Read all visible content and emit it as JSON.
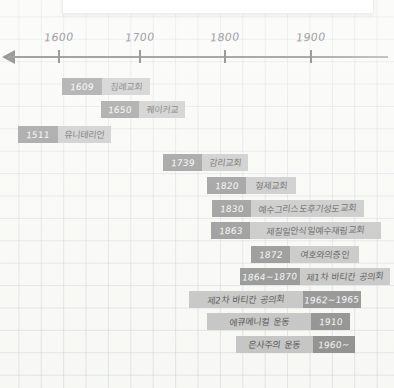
{
  "caption": {
    "text": "( 자료 출처 : 한국 기독교 총람(교회사, 2010)"
  },
  "axis": {
    "ticks": [
      {
        "label": "1600",
        "x": 58
      },
      {
        "label": "1700",
        "x": 139
      },
      {
        "label": "1800",
        "x": 224
      },
      {
        "label": "1900",
        "x": 310
      }
    ]
  },
  "colors": {
    "date_block": "#7b7b7b",
    "label_block": "#b9b9b9",
    "axis": "#3c3c3c",
    "paper": "#f7f7f3",
    "grid": "#96aabe"
  },
  "events": [
    {
      "date": "1609",
      "label": "침례교회",
      "x": 62,
      "y": 78,
      "date_w": 32,
      "total_w": 88,
      "reversed": false
    },
    {
      "date": "1650",
      "label": "퀘이커교",
      "x": 101,
      "y": 101,
      "date_w": 30,
      "total_w": 84,
      "reversed": false
    },
    {
      "date": "1511",
      "label": "유니테리언",
      "x": 18,
      "y": 126,
      "date_w": 32,
      "total_w": 92,
      "reversed": false
    },
    {
      "date": "1739",
      "label": "감리교회",
      "x": 163,
      "y": 154,
      "date_w": 31,
      "total_w": 85,
      "reversed": false
    },
    {
      "date": "1820",
      "label": "형제교회",
      "x": 207,
      "y": 177,
      "date_w": 31,
      "total_w": 89,
      "reversed": false
    },
    {
      "date": "1830",
      "label": "예수그리스도후기성도교회",
      "x": 212,
      "y": 200,
      "date_w": 31,
      "total_w": 152,
      "reversed": false
    },
    {
      "date": "1863",
      "label": "제칠일안식일예수재림교회",
      "x": 211,
      "y": 222,
      "date_w": 31,
      "total_w": 170,
      "reversed": false
    },
    {
      "date": "1872",
      "label": "여호와의증인",
      "x": 251,
      "y": 246,
      "date_w": 31,
      "total_w": 108,
      "reversed": false
    },
    {
      "date": "1864~1870",
      "label": "제1차 바티칸 공의회",
      "x": 240,
      "y": 268,
      "date_w": 52,
      "total_w": 148,
      "reversed": false
    },
    {
      "date": "1962~1965",
      "label": "제2차 바티칸 공의회",
      "x": 189,
      "y": 291,
      "date_w": 50,
      "total_w": 172,
      "reversed": true
    },
    {
      "date": "1910",
      "label": "에큐메니컬 운동",
      "x": 207,
      "y": 313,
      "date_w": 31,
      "total_w": 143,
      "reversed": true
    },
    {
      "date": "1960~",
      "label": "은사주의 운동",
      "x": 236,
      "y": 336,
      "date_w": 34,
      "total_w": 119,
      "reversed": true
    }
  ]
}
